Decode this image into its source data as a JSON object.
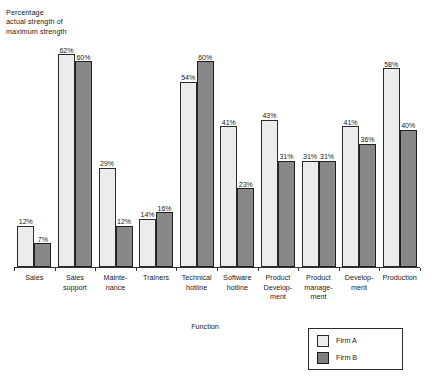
{
  "chart_data": {
    "type": "bar",
    "title": "",
    "ylabel": "Percentage\nactual strength of\nmaximum strength",
    "xlabel": "Function",
    "ylim": [
      0,
      72
    ],
    "grid": false,
    "legend_position": "bottom-right",
    "value_label_suffix": "%",
    "categories": [
      "Sales",
      "Sales\nsupport",
      "Mainte-\nnance",
      "Trainers",
      "Technical\nhotline",
      "Software\nhotline",
      "Product\nDevelop-\nment",
      "Product\nmanage-\nment",
      "Develop-\nment",
      "Production"
    ],
    "series": [
      {
        "name": "Firm A",
        "color": "#ececec",
        "values": [
          12,
          62,
          29,
          14,
          54,
          41,
          43,
          31,
          41,
          58
        ],
        "value_labels": [
          "12%",
          "62%",
          "29%",
          "14%",
          "54%",
          "41%",
          "43%",
          "31%",
          "41%",
          "58%"
        ]
      },
      {
        "name": "Firm B",
        "color": "#888888",
        "values": [
          7,
          60,
          12,
          16,
          60,
          23,
          31,
          31,
          36,
          40
        ],
        "value_labels": [
          "7%",
          "60%",
          "12%",
          "16%",
          "60%",
          "23%",
          "31%",
          "31%",
          "36%",
          "40%"
        ]
      }
    ]
  },
  "legend": {
    "items": [
      {
        "label": "Firm A"
      },
      {
        "label": "Firm B"
      }
    ]
  }
}
